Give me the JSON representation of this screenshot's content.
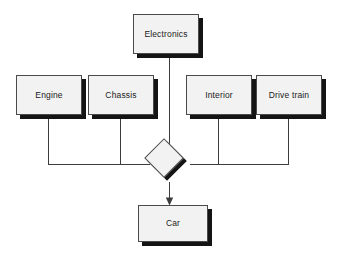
{
  "diagram": {
    "type": "aggregation-composition-diagram",
    "canvas": {
      "width": 337,
      "height": 264,
      "background": "#ffffff"
    },
    "style": {
      "node_fill": "#f2f2f2",
      "node_border": "#4a4a4a",
      "shadow": "#141414",
      "connector": "#3c3c3c",
      "text": "#1a1a1a"
    },
    "nodes": [
      {
        "id": "electronics",
        "label": "Electronics",
        "shape": "rect",
        "x": 133,
        "y": 14,
        "w": 66,
        "h": 40
      },
      {
        "id": "engine",
        "label": "Engine",
        "shape": "rect",
        "x": 16,
        "y": 75,
        "w": 66,
        "h": 40
      },
      {
        "id": "chassis",
        "label": "Chassis",
        "shape": "rect",
        "x": 88,
        "y": 75,
        "w": 66,
        "h": 40
      },
      {
        "id": "interior",
        "label": "Interior",
        "shape": "rect",
        "x": 186,
        "y": 75,
        "w": 66,
        "h": 40
      },
      {
        "id": "drive-train",
        "label": "Drive train",
        "shape": "rect",
        "x": 256,
        "y": 75,
        "w": 66,
        "h": 40
      },
      {
        "id": "junction",
        "label": "",
        "shape": "diamond",
        "x": 150,
        "y": 144,
        "w": 40,
        "h": 40
      },
      {
        "id": "car",
        "label": "Car",
        "shape": "rect",
        "x": 138,
        "y": 205,
        "w": 70,
        "h": 37
      }
    ],
    "edges": [
      {
        "from": "electronics",
        "to": "junction",
        "style": "plain"
      },
      {
        "from": "engine",
        "to": "junction",
        "style": "elbow"
      },
      {
        "from": "chassis",
        "to": "junction",
        "style": "elbow"
      },
      {
        "from": "interior",
        "to": "junction",
        "style": "elbow"
      },
      {
        "from": "drive-train",
        "to": "junction",
        "style": "elbow"
      },
      {
        "from": "junction",
        "to": "car",
        "style": "arrow"
      }
    ]
  }
}
